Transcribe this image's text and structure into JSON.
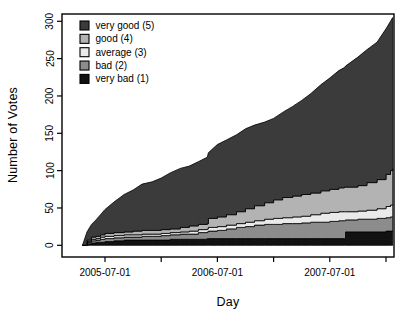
{
  "figure": {
    "kind": "statistical-plot",
    "background": "#ffffff",
    "frame_color": "#000000"
  },
  "chart_data": {
    "type": "area",
    "variant": "stacked-cumulative-votes",
    "title": "",
    "xlabel": "Day",
    "ylabel": "Number of Votes",
    "grid": "off",
    "x_unit": "decimal-year",
    "xlim_years": [
      2005.22,
      2008.14
    ],
    "ylim": [
      -12,
      317
    ],
    "y_ticks": [
      0,
      50,
      100,
      150,
      200,
      250,
      300
    ],
    "x_ticks": [
      {
        "year": 2005.5,
        "label": "2005-07-01"
      },
      {
        "year": 2006.0,
        "label": ""
      },
      {
        "year": 2006.5,
        "label": "2006-07-01"
      },
      {
        "year": 2007.0,
        "label": ""
      },
      {
        "year": 2007.5,
        "label": "2007-07-01"
      },
      {
        "year": 2008.0,
        "label": ""
      }
    ],
    "x": [
      2005.3,
      2005.34,
      2005.38,
      2005.42,
      2005.46,
      2005.5,
      2005.58,
      2005.67,
      2005.75,
      2005.83,
      2005.92,
      2006.0,
      2006.08,
      2006.17,
      2006.25,
      2006.33,
      2006.41,
      2006.42,
      2006.5,
      2006.58,
      2006.67,
      2006.75,
      2006.83,
      2006.92,
      2007.0,
      2007.08,
      2007.17,
      2007.25,
      2007.33,
      2007.42,
      2007.5,
      2007.58,
      2007.63,
      2007.64,
      2007.75,
      2007.83,
      2007.92,
      2008.0,
      2008.04,
      2008.06
    ],
    "series": [
      {
        "name": "very bad (1)",
        "level": 1,
        "color": "#121212",
        "stack_top": [
          0,
          2,
          3,
          4,
          4,
          5,
          6,
          7,
          7,
          7,
          7,
          7,
          8,
          8,
          8,
          8,
          9,
          9,
          9,
          9,
          9,
          9,
          9,
          9,
          9,
          9,
          9,
          9,
          9,
          9,
          9,
          9,
          9,
          18,
          18,
          18,
          18,
          19,
          19,
          19
        ]
      },
      {
        "name": "bad (2)",
        "level": 2,
        "color": "#8c8c8c",
        "stack_top": [
          0,
          4,
          6,
          7,
          8,
          9,
          10,
          11,
          11,
          12,
          12,
          13,
          14,
          15,
          15,
          17,
          18,
          19,
          20,
          22,
          24,
          25,
          27,
          28,
          28,
          29,
          29,
          30,
          31,
          31,
          32,
          33,
          33,
          34,
          35,
          35,
          36,
          37,
          38,
          38
        ]
      },
      {
        "name": "average (3)",
        "level": 3,
        "color": "#eaeaea",
        "stack_top": [
          0,
          5,
          8,
          9,
          11,
          12,
          13,
          14,
          14,
          15,
          15,
          16,
          17,
          18,
          19,
          21,
          22,
          24,
          25,
          27,
          29,
          31,
          33,
          35,
          36,
          37,
          38,
          39,
          41,
          43,
          44,
          45,
          45,
          45,
          46,
          47,
          49,
          52,
          54,
          55
        ]
      },
      {
        "name": "good (4)",
        "level": 4,
        "color": "#b3b3b3",
        "stack_top": [
          0,
          7,
          11,
          12,
          14,
          16,
          17,
          18,
          19,
          20,
          20,
          21,
          22,
          24,
          26,
          28,
          29,
          36,
          38,
          41,
          45,
          49,
          53,
          57,
          61,
          64,
          66,
          68,
          70,
          73,
          75,
          77,
          78,
          78,
          80,
          84,
          88,
          95,
          100,
          103
        ]
      },
      {
        "name": "very good (5)",
        "level": 5,
        "color": "#3b3b3b",
        "stack_top": [
          0,
          18,
          28,
          34,
          41,
          48,
          58,
          68,
          74,
          82,
          85,
          90,
          97,
          103,
          106,
          112,
          118,
          124,
          135,
          141,
          148,
          156,
          161,
          165,
          170,
          178,
          186,
          194,
          203,
          215,
          224,
          234,
          238,
          240,
          252,
          262,
          272,
          290,
          300,
          305
        ]
      }
    ],
    "legend": {
      "position": "top-left-inside",
      "order": [
        "very good (5)",
        "good (4)",
        "average (3)",
        "bad (2)",
        "very bad (1)"
      ]
    },
    "outline_color": "#000000"
  }
}
